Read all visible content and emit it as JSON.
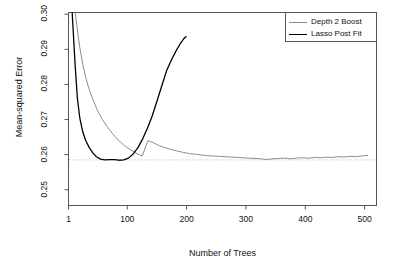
{
  "chart_data": {
    "type": "line",
    "title": "",
    "xlabel": "Number of Trees",
    "ylabel": "Mean-squared Error",
    "xlim": [
      1,
      520
    ],
    "ylim": [
      0.2455,
      0.3005
    ],
    "xticks": [
      1,
      100,
      200,
      300,
      400,
      500
    ],
    "xticklabels": [
      "1",
      "100",
      "200",
      "300",
      "400",
      "500"
    ],
    "yticks": [
      0.25,
      0.26,
      0.27,
      0.28,
      0.29,
      0.3
    ],
    "yticklabels": [
      "0.25",
      "0.26",
      "0.27",
      "0.28",
      "0.29",
      "0.30"
    ],
    "grid": false,
    "legend_position": "top-right",
    "reference_line": {
      "orientation": "horizontal",
      "value": 0.2585,
      "style": "dotted",
      "color": "#bdbdbd"
    },
    "series": [
      {
        "name": "Depth 2 Boost",
        "color": "#8c8c8c",
        "width": 1,
        "x": [
          8,
          12,
          16,
          20,
          25,
          30,
          36,
          42,
          50,
          58,
          66,
          75,
          85,
          95,
          105,
          115,
          125,
          135,
          145,
          155,
          165,
          175,
          185,
          195,
          205,
          215,
          225,
          235,
          245,
          255,
          265,
          275,
          285,
          295,
          305,
          315,
          325,
          335,
          345,
          355,
          365,
          375,
          385,
          395,
          405,
          415,
          425,
          435,
          445,
          455,
          465,
          475,
          485,
          495,
          505
        ],
        "y": [
          0.307,
          0.301,
          0.2955,
          0.2905,
          0.2858,
          0.282,
          0.2785,
          0.2757,
          0.2725,
          0.27,
          0.268,
          0.266,
          0.2641,
          0.2626,
          0.2614,
          0.2604,
          0.2596,
          0.264,
          0.2633,
          0.2625,
          0.2619,
          0.2614,
          0.261,
          0.2606,
          0.2603,
          0.2601,
          0.2599,
          0.2597,
          0.2596,
          0.2595,
          0.2594,
          0.2593,
          0.2592,
          0.2591,
          0.259,
          0.2589,
          0.2588,
          0.2586,
          0.2588,
          0.2589,
          0.259,
          0.2588,
          0.259,
          0.2591,
          0.259,
          0.2592,
          0.2591,
          0.2593,
          0.2592,
          0.2594,
          0.2593,
          0.2595,
          0.2594,
          0.2596,
          0.2598
        ]
      },
      {
        "name": "Lasso Post Fit",
        "color": "#000000",
        "width": 1.3,
        "x": [
          5,
          8,
          12,
          16,
          20,
          25,
          30,
          36,
          42,
          48,
          55,
          62,
          70,
          78,
          86,
          94,
          102,
          110,
          118,
          126,
          134,
          142,
          150,
          158,
          166,
          174,
          182,
          190,
          196,
          199
        ],
        "y": [
          0.308,
          0.298,
          0.286,
          0.276,
          0.2705,
          0.2665,
          0.264,
          0.262,
          0.2605,
          0.2594,
          0.2587,
          0.2585,
          0.2586,
          0.2586,
          0.2584,
          0.2585,
          0.259,
          0.2602,
          0.262,
          0.2645,
          0.2675,
          0.271,
          0.2752,
          0.2795,
          0.2838,
          0.2868,
          0.2895,
          0.2918,
          0.2932,
          0.2936
        ]
      }
    ]
  },
  "axes": {
    "y_title": "Mean-squared Error",
    "x_title": "Number of Trees"
  },
  "legend": {
    "entries": [
      {
        "label": "Depth 2 Boost",
        "color": "#8c8c8c"
      },
      {
        "label": "Lasso Post Fit",
        "color": "#000000"
      }
    ]
  }
}
